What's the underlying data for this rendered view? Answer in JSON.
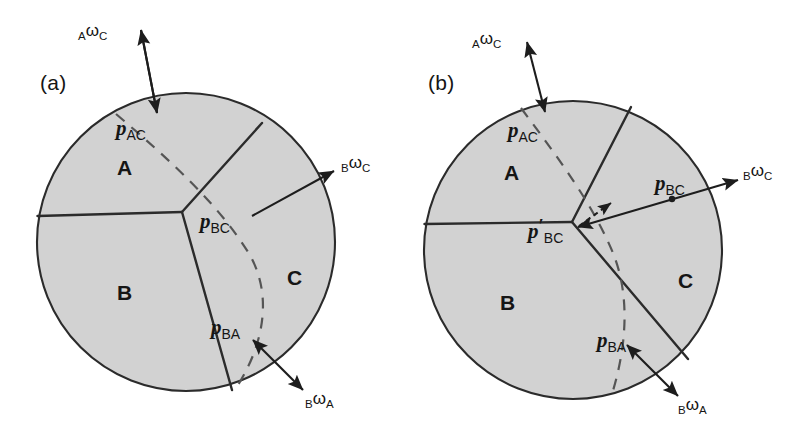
{
  "figure": {
    "background_color": "#ffffff",
    "disk_fill_color": "#d2d2d2",
    "line_color": "#2b2b2b",
    "dash_color": "#555555"
  },
  "panels": [
    {
      "id": "a",
      "label": "(a)",
      "regions": [
        {
          "id": "A",
          "label": "A"
        },
        {
          "id": "B",
          "label": "B"
        },
        {
          "id": "C",
          "label": "C"
        }
      ],
      "points": [
        {
          "id": "p_AC",
          "symbol": "p",
          "subscript": "AC",
          "prime": ""
        },
        {
          "id": "p_BC",
          "symbol": "p",
          "subscript": "BC",
          "prime": ""
        },
        {
          "id": "p_BA",
          "symbol": "p",
          "subscript": "BA",
          "prime": ""
        }
      ],
      "vectors": [
        {
          "id": "A_omega_C",
          "pre": "A",
          "symbol": "ω",
          "post": "C"
        },
        {
          "id": "B_omega_C",
          "pre": "B",
          "symbol": "ω",
          "post": "C"
        },
        {
          "id": "B_omega_A",
          "pre": "B",
          "symbol": "ω",
          "post": "A"
        }
      ]
    },
    {
      "id": "b",
      "label": "(b)",
      "regions": [
        {
          "id": "A",
          "label": "A"
        },
        {
          "id": "B",
          "label": "B"
        },
        {
          "id": "C",
          "label": "C"
        }
      ],
      "points": [
        {
          "id": "p_AC",
          "symbol": "p",
          "subscript": "AC",
          "prime": ""
        },
        {
          "id": "p_BC",
          "symbol": "p",
          "subscript": "BC",
          "prime": ""
        },
        {
          "id": "p_BC_prime",
          "symbol": "p",
          "subscript": "BC",
          "prime": "′"
        },
        {
          "id": "p_BA",
          "symbol": "p",
          "subscript": "BA",
          "prime": ""
        }
      ],
      "vectors": [
        {
          "id": "A_omega_C",
          "pre": "A",
          "symbol": "ω",
          "post": "C"
        },
        {
          "id": "B_omega_C",
          "pre": "B",
          "symbol": "ω",
          "post": "C"
        },
        {
          "id": "B_omega_A",
          "pre": "B",
          "symbol": "ω",
          "post": "A"
        }
      ]
    }
  ]
}
